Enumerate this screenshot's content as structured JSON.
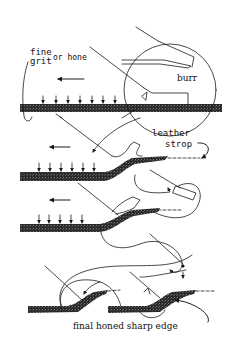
{
  "labels": {
    "fine_grit_line1": "fine",
    "fine_grit_line2": "grit",
    "or_hone": "or hone",
    "burr": "burr",
    "leather": "leather",
    "strop": "strop",
    "final": "final honed sharp edge"
  },
  "colors": {
    "ink": "#1a1a1a",
    "stone": "#222222",
    "background": "#ffffff"
  }
}
